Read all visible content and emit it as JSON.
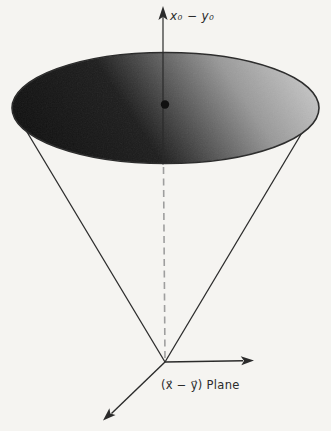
{
  "diagram": {
    "axis_label": "x₀ − y₀",
    "plane_label": "(x⃗ − y⃗) Plane"
  },
  "icons": {
    "time_axis_arrowhead": "filled-arrowhead-up",
    "plane_right_arrowhead": "filled-arrowhead-right",
    "plane_lower_left_arrowhead": "filled-arrowhead-lower-left"
  },
  "theme": {
    "paper": "#f5f4f1",
    "ink": "#2b2b2b",
    "dash": "#9e9e9e",
    "dot": "#101010",
    "grad0": "#0f0f0f",
    "grad1": "#1d1d1d",
    "grad2": "#585858",
    "grad3": "#999999",
    "grad4": "#c6c6c6"
  }
}
